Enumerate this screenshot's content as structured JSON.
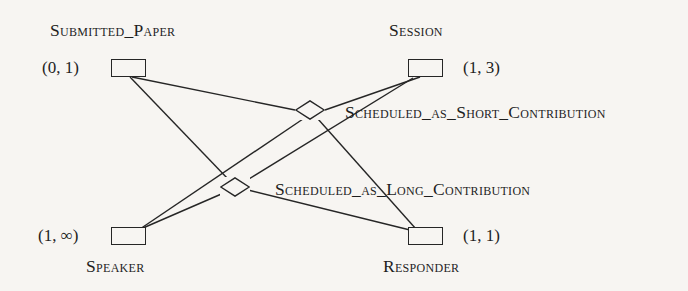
{
  "diagram": {
    "type": "er-diagram",
    "notation": "min-max cardinality",
    "background_color": "#f7f5f2",
    "line_color": "#262626",
    "entities": [
      {
        "id": "submitted_paper",
        "name": "Submitted_Paper",
        "cardinality": "(0, 1)",
        "box": {
          "x": 111,
          "y": 59,
          "w": 35,
          "h": 18
        },
        "name_pos": {
          "x": 50,
          "y": 22
        },
        "card_pos": {
          "x": 42,
          "y": 59
        }
      },
      {
        "id": "session",
        "name": "Session",
        "cardinality": "(1, 3)",
        "box": {
          "x": 408,
          "y": 59,
          "w": 35,
          "h": 18
        },
        "name_pos": {
          "x": 389,
          "y": 22
        },
        "card_pos": {
          "x": 463,
          "y": 59
        }
      },
      {
        "id": "speaker",
        "name": "Speaker",
        "cardinality": "(1, ∞)",
        "box": {
          "x": 111,
          "y": 227,
          "w": 35,
          "h": 18
        },
        "name_pos": {
          "x": 86,
          "y": 258
        },
        "card_pos": {
          "x": 38,
          "y": 227
        }
      },
      {
        "id": "responder",
        "name": "Responder",
        "cardinality": "(1, 1)",
        "box": {
          "x": 408,
          "y": 227,
          "w": 35,
          "h": 18
        },
        "name_pos": {
          "x": 383,
          "y": 258
        },
        "card_pos": {
          "x": 463,
          "y": 227
        }
      }
    ],
    "relationships": [
      {
        "id": "scheduled_as_short_contribution",
        "name": "Scheduled_as_Short_Contribution",
        "center": {
          "x": 310,
          "y": 110
        },
        "rx": 15,
        "ry": 10,
        "label_pos": {
          "x": 345,
          "y": 104
        },
        "connects": [
          "submitted_paper",
          "session",
          "speaker",
          "responder"
        ]
      },
      {
        "id": "scheduled_as_long_contribution",
        "name": "Scheduled_as_Long_Contribution",
        "center": {
          "x": 235,
          "y": 187
        },
        "rx": 15,
        "ry": 10,
        "label_pos": {
          "x": 275,
          "y": 181
        },
        "connects": [
          "submitted_paper",
          "session",
          "speaker",
          "responder"
        ]
      }
    ],
    "edges": [
      {
        "id": "edge-paper-short",
        "from": "submitted_paper",
        "to": "scheduled_as_short_contribution",
        "x1": 132,
        "y1": 77,
        "x2": 295,
        "y2": 110
      },
      {
        "id": "edge-session-short",
        "from": "session",
        "to": "scheduled_as_short_contribution",
        "x1": 420,
        "y1": 77,
        "x2": 325,
        "y2": 110
      },
      {
        "id": "edge-speaker-short",
        "from": "speaker",
        "to": "scheduled_as_short_contribution",
        "x1": 140,
        "y1": 229,
        "x2": 303,
        "y2": 119
      },
      {
        "id": "edge-responder-short",
        "from": "responder",
        "to": "scheduled_as_short_contribution",
        "x1": 416,
        "y1": 229,
        "x2": 318,
        "y2": 119
      },
      {
        "id": "edge-paper-long",
        "from": "submitted_paper",
        "to": "scheduled_as_long_contribution",
        "x1": 130,
        "y1": 77,
        "x2": 228,
        "y2": 179
      },
      {
        "id": "edge-session-long",
        "from": "session",
        "to": "scheduled_as_long_contribution",
        "x1": 413,
        "y1": 78,
        "x2": 244,
        "y2": 182
      },
      {
        "id": "edge-speaker-long",
        "from": "speaker",
        "to": "scheduled_as_long_contribution",
        "x1": 143,
        "y1": 228,
        "x2": 226,
        "y2": 192
      },
      {
        "id": "edge-responder-long",
        "from": "responder",
        "to": "scheduled_as_long_contribution",
        "x1": 410,
        "y1": 230,
        "x2": 248,
        "y2": 190
      }
    ]
  }
}
